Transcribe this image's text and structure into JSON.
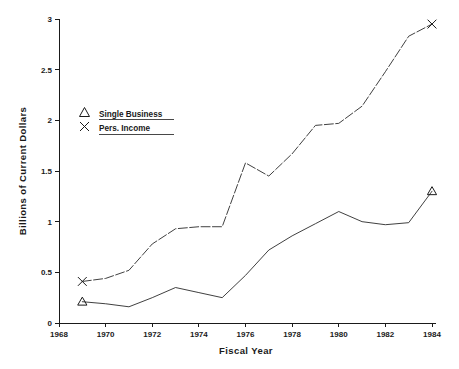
{
  "chart_data": {
    "type": "line",
    "title": "",
    "xlabel": "Fiscal Year",
    "ylabel": "Billions of Current Dollars",
    "xlim": [
      1968,
      1984
    ],
    "ylim": [
      0,
      3
    ],
    "grid": false,
    "legend_position": "upper-left-inside",
    "x_ticks": [
      1968,
      1970,
      1972,
      1974,
      1976,
      1978,
      1980,
      1982,
      1984
    ],
    "x_tick_labels": [
      "1968",
      "1970",
      "1972",
      "1974",
      "1976",
      "1978",
      "1980",
      "1982",
      "1984"
    ],
    "y_ticks": [
      0,
      0.5,
      1,
      1.5,
      2,
      2.5,
      3
    ],
    "y_tick_labels": [
      "0",
      "0.5",
      "1",
      "1.5",
      "2",
      "2.5",
      "3"
    ],
    "x": [
      1969,
      1970,
      1971,
      1972,
      1973,
      1974,
      1975,
      1976,
      1977,
      1978,
      1979,
      1980,
      1981,
      1982,
      1983,
      1984
    ],
    "series": [
      {
        "name": "Single Business",
        "marker": "triangle",
        "line_style": "solid",
        "marker_years": [
          1969,
          1984
        ],
        "values": [
          0.21,
          0.19,
          0.16,
          0.25,
          0.35,
          0.3,
          0.25,
          0.47,
          0.72,
          0.86,
          0.98,
          1.1,
          1.0,
          0.97,
          0.99,
          1.3
        ]
      },
      {
        "name": "Pers. Income",
        "marker": "x",
        "line_style": "dashed",
        "marker_years": [
          1969,
          1984
        ],
        "values": [
          0.41,
          0.44,
          0.52,
          0.78,
          0.93,
          0.95,
          0.95,
          1.58,
          1.45,
          1.67,
          1.95,
          1.97,
          2.14,
          2.48,
          2.83,
          2.95
        ]
      }
    ]
  },
  "legend": {
    "items": [
      {
        "label": "Single Business",
        "glyph": "triangle-marker"
      },
      {
        "label": "Pers. Income",
        "glyph": "x-marker"
      }
    ]
  },
  "axes": {
    "x_title": "Fiscal Year",
    "y_title": "Billions of Current Dollars"
  }
}
